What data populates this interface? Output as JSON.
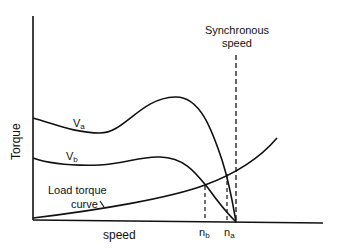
{
  "diagram": {
    "title": "",
    "axes": {
      "y_label": "Torque",
      "x_label": "speed"
    },
    "curves": {
      "va": {
        "label": "V",
        "subscript": "a"
      },
      "vb": {
        "label": "V",
        "subscript": "b"
      },
      "load": {
        "label_line1": "Load torque",
        "label_line2": "curve"
      }
    },
    "markers": {
      "synchronous_line1": "Synchronous",
      "synchronous_line2": "speed",
      "nb": {
        "label": "n",
        "subscript": "b"
      },
      "na": {
        "label": "n",
        "subscript": "a"
      }
    },
    "colors": {
      "line": "#111111",
      "background": "#ffffff"
    }
  }
}
